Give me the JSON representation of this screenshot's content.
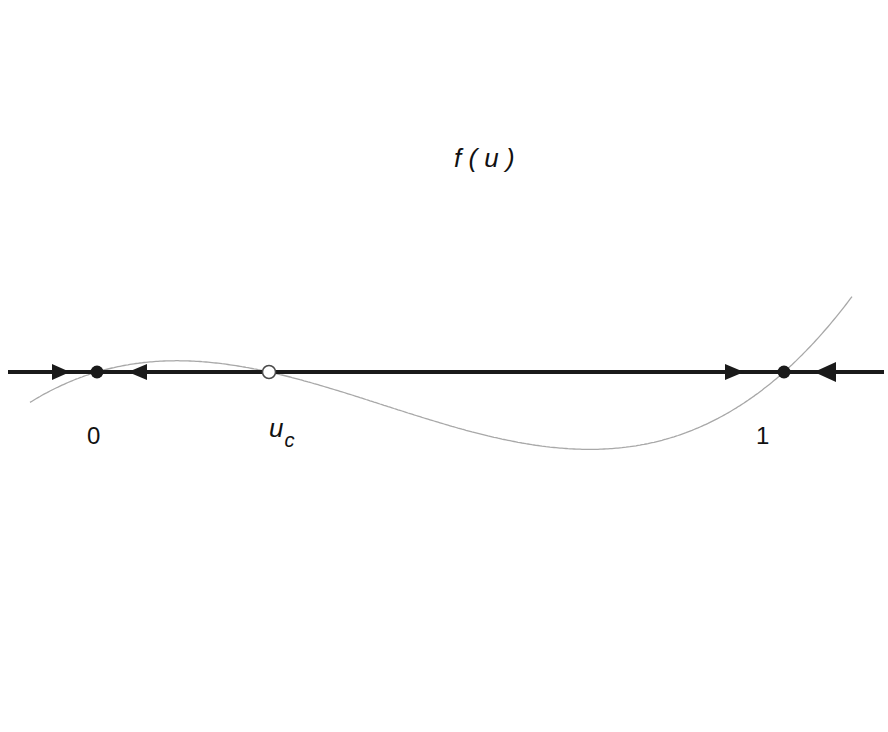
{
  "diagram": {
    "type": "phase-line",
    "curve_label": "f ( u )",
    "colors": {
      "curve": "#a8a8a8",
      "axis": "#1a1a1a",
      "stable_point": "#1a1a1a",
      "unstable_point_stroke": "#4a4a4a",
      "background": "#ffffff"
    },
    "fixed_points": [
      {
        "label": "0",
        "type": "stable",
        "marker": "filled-circle"
      },
      {
        "label": "u",
        "subscript": "c",
        "type": "unstable",
        "marker": "open-circle"
      },
      {
        "label": "1",
        "type": "stable",
        "marker": "filled-circle"
      }
    ],
    "flow_arrows": [
      {
        "position": "left of 0",
        "direction": "right"
      },
      {
        "position": "between 0 and u_c",
        "direction": "left"
      },
      {
        "position": "between u_c and 1",
        "direction": "right"
      },
      {
        "position": "right of 1",
        "direction": "left"
      }
    ]
  },
  "labels": {
    "curve": "f ( u )",
    "zero": "0",
    "uc_main": "u",
    "uc_sub": "c",
    "one": "1"
  }
}
